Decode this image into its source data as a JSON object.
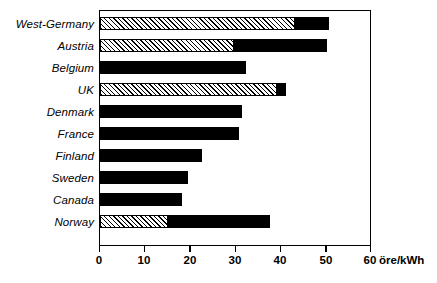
{
  "chart_data": {
    "type": "bar",
    "orientation": "horizontal",
    "title": "",
    "xlabel": "öre/kWh",
    "ylabel": "",
    "xlim": [
      0,
      60
    ],
    "xticks": [
      0,
      10,
      20,
      30,
      40,
      50,
      60
    ],
    "xtick_labels": [
      "0",
      "10",
      "20",
      "30",
      "40",
      "50",
      "60"
    ],
    "grid": false,
    "legend": "none",
    "stacked": true,
    "categories": [
      "West-Germany",
      "Austria",
      "Belgium",
      "UK",
      "Denmark",
      "France",
      "Finland",
      "Sweden",
      "Canada",
      "Norway"
    ],
    "series": [
      {
        "name": "hatched",
        "style": "diagonal-hatch",
        "values": [
          43.0,
          29.5,
          0,
          39.0,
          0,
          0,
          0,
          0,
          0,
          14.9
        ]
      },
      {
        "name": "solid",
        "style": "solid-black",
        "values": [
          7.5,
          20.5,
          32.3,
          2.0,
          31.3,
          30.6,
          22.5,
          19.5,
          18.0,
          22.6
        ]
      }
    ],
    "totals": [
      50.5,
      50.0,
      32.3,
      41.0,
      31.3,
      30.6,
      22.5,
      19.5,
      18.0,
      37.5
    ],
    "colors": {
      "solid": "#000000",
      "hatch_line": "#000000",
      "hatch_background": "#ffffff",
      "frame": "#000000",
      "text": "#000000",
      "background": "#ffffff"
    }
  }
}
